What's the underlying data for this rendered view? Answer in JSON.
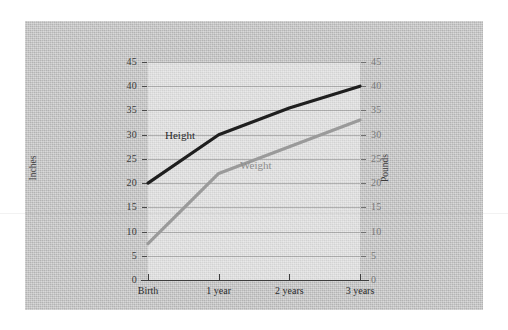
{
  "chart_data": {
    "type": "line",
    "title": "",
    "subtitle": "",
    "xlabel": "",
    "ylabel": "Inches",
    "y2label": "Pounds",
    "categories": [
      "Birth",
      "1 year",
      "2 years",
      "3 years"
    ],
    "ylim": [
      0,
      45
    ],
    "y2lim": [
      0,
      45
    ],
    "yticks": [
      0,
      5,
      10,
      15,
      20,
      25,
      30,
      35,
      40,
      45
    ],
    "y2ticks": [
      0,
      5,
      10,
      15,
      20,
      25,
      30,
      35,
      40,
      45
    ],
    "grid": true,
    "legend_position": "inline-annotations",
    "series": [
      {
        "name": "Height",
        "axis": "left",
        "unit": "inches",
        "color": "#1f1f1f",
        "values": [
          20,
          30,
          35.5,
          40
        ]
      },
      {
        "name": "Weight",
        "axis": "right",
        "unit": "pounds",
        "color": "#9a9a9a",
        "values": [
          7.5,
          22,
          27.5,
          33
        ]
      }
    ],
    "annotations": [
      {
        "text": "Height",
        "series": "Height",
        "color": "#2a2a2a"
      },
      {
        "text": "Weight",
        "series": "Weight",
        "color": "#8e8e8e"
      }
    ]
  },
  "axes": {
    "left": {
      "title": "Inches",
      "tick_labels": [
        "45",
        "40",
        "35",
        "30",
        "25",
        "20",
        "15",
        "10",
        "5",
        "0"
      ]
    },
    "right": {
      "title": "Pounds",
      "tick_labels": [
        "45",
        "40",
        "35",
        "30",
        "25",
        "20",
        "15",
        "10",
        "5",
        "0"
      ]
    },
    "bottom": {
      "tick_labels": [
        "Birth",
        "1 year",
        "2 years",
        "3 years"
      ]
    }
  },
  "colors": {
    "panel_background": "#c3c3c3",
    "plot_background": "#d6d6d6",
    "height_line": "#1f1f1f",
    "weight_line": "#9a9a9a",
    "axis": "#3e3e3e",
    "gridline": "#6e6e6e"
  }
}
